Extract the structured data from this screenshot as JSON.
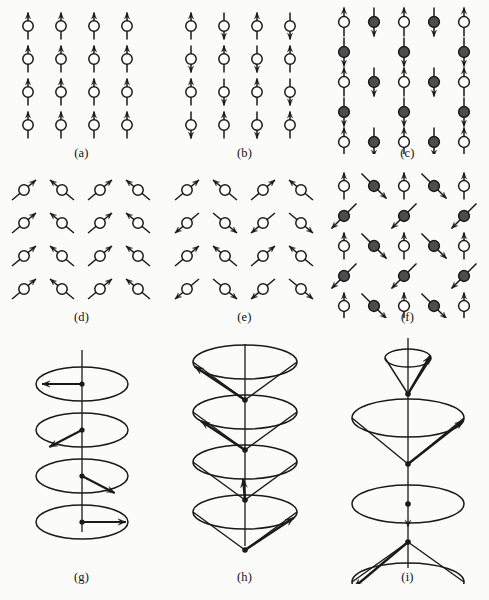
{
  "figure": {
    "background_color": "#fbfbf9",
    "ink_color": "#1a1a1a",
    "filled_circle_color": "#4d4d4d",
    "open_circle_color": "#ffffff",
    "width": 489,
    "height": 600
  },
  "panels": [
    {
      "id": "a",
      "caption": "(a)",
      "name": "ferromagnetic",
      "lattice": {
        "cols": 4,
        "rows": 4,
        "dx": 33,
        "dy": 33,
        "x0": 28,
        "y0": 22
      },
      "site_style": "open-circle-vertical-spin",
      "spins": [
        [
          "up",
          "up",
          "up",
          "up"
        ],
        [
          "up",
          "up",
          "up",
          "up"
        ],
        [
          "up",
          "up",
          "up",
          "up"
        ],
        [
          "up",
          "up",
          "up",
          "up"
        ]
      ]
    },
    {
      "id": "b",
      "caption": "(b)",
      "name": "antiferromagnetic",
      "lattice": {
        "cols": 4,
        "rows": 4,
        "dx": 33,
        "dy": 33,
        "x0": 28,
        "y0": 22
      },
      "site_style": "open-circle-vertical-spin",
      "spins": [
        [
          "up",
          "down",
          "up",
          "down"
        ],
        [
          "down",
          "up",
          "down",
          "up"
        ],
        [
          "up",
          "down",
          "up",
          "down"
        ],
        [
          "down",
          "up",
          "down",
          "up"
        ]
      ]
    },
    {
      "id": "c",
      "caption": "(c)",
      "name": "ferrimagnetic",
      "lattice": {
        "cols": 5,
        "rows": 5,
        "dx": 30,
        "dy": 30,
        "x0": 18,
        "y0": 18
      },
      "site_style": "two-sublattice-vertical-spin",
      "cells": [
        [
          {
            "fill": "open",
            "spin": "up"
          },
          {
            "fill": "solid",
            "spin": "down"
          },
          {
            "fill": "open",
            "spin": "up"
          },
          {
            "fill": "solid",
            "spin": "down"
          },
          {
            "fill": "open",
            "spin": "up"
          }
        ],
        [
          {
            "fill": "solid",
            "spin": "down"
          },
          {
            "fill": "none",
            "spin": "none"
          },
          {
            "fill": "solid",
            "spin": "down"
          },
          {
            "fill": "none",
            "spin": "none"
          },
          {
            "fill": "solid",
            "spin": "down"
          }
        ],
        [
          {
            "fill": "open",
            "spin": "up"
          },
          {
            "fill": "solid",
            "spin": "down"
          },
          {
            "fill": "open",
            "spin": "up"
          },
          {
            "fill": "solid",
            "spin": "down"
          },
          {
            "fill": "open",
            "spin": "up"
          }
        ],
        [
          {
            "fill": "solid",
            "spin": "down"
          },
          {
            "fill": "none",
            "spin": "none"
          },
          {
            "fill": "solid",
            "spin": "down"
          },
          {
            "fill": "none",
            "spin": "none"
          },
          {
            "fill": "solid",
            "spin": "down"
          }
        ],
        [
          {
            "fill": "open",
            "spin": "up"
          },
          {
            "fill": "solid",
            "spin": "down"
          },
          {
            "fill": "open",
            "spin": "up"
          },
          {
            "fill": "solid",
            "spin": "down"
          },
          {
            "fill": "open",
            "spin": "up"
          }
        ]
      ]
    },
    {
      "id": "d",
      "caption": "(d)",
      "name": "canted-ferromagnetic",
      "lattice": {
        "cols": 4,
        "rows": 4,
        "dx": 38,
        "dy": 33,
        "x0": 24,
        "y0": 22
      },
      "site_style": "open-circle-tilted-spin",
      "angles_deg": [
        [
          40,
          140,
          40,
          140
        ],
        [
          40,
          140,
          40,
          140
        ],
        [
          40,
          140,
          40,
          140
        ],
        [
          40,
          140,
          40,
          140
        ]
      ]
    },
    {
      "id": "e",
      "caption": "(e)",
      "name": "canted-antiferromagnetic",
      "lattice": {
        "cols": 4,
        "rows": 4,
        "dx": 38,
        "dy": 33,
        "x0": 24,
        "y0": 22
      },
      "site_style": "open-circle-tilted-spin",
      "angles_deg": [
        [
          40,
          140,
          40,
          140
        ],
        [
          220,
          320,
          220,
          320
        ],
        [
          40,
          140,
          40,
          140
        ],
        [
          220,
          320,
          220,
          320
        ]
      ]
    },
    {
      "id": "f",
      "caption": "(f)",
      "name": "mixed-sublattice-canted",
      "lattice": {
        "cols": 5,
        "rows": 5,
        "dx": 30,
        "dy": 30,
        "x0": 18,
        "y0": 18
      },
      "site_style": "two-sublattice-mixed-spin",
      "cells": [
        [
          {
            "fill": "open",
            "angle": 90
          },
          {
            "fill": "solid",
            "angle": -45
          },
          {
            "fill": "open",
            "angle": 90
          },
          {
            "fill": "solid",
            "angle": -45
          },
          {
            "fill": "open",
            "angle": 90
          }
        ],
        [
          {
            "fill": "solid",
            "angle": -135
          },
          {
            "fill": "none",
            "angle": null
          },
          {
            "fill": "solid",
            "angle": -135
          },
          {
            "fill": "none",
            "angle": null
          },
          {
            "fill": "solid",
            "angle": -135
          }
        ],
        [
          {
            "fill": "open",
            "angle": 90
          },
          {
            "fill": "solid",
            "angle": -45
          },
          {
            "fill": "open",
            "angle": 90
          },
          {
            "fill": "solid",
            "angle": -45
          },
          {
            "fill": "open",
            "angle": 90
          }
        ],
        [
          {
            "fill": "solid",
            "angle": -135
          },
          {
            "fill": "none",
            "angle": null
          },
          {
            "fill": "solid",
            "angle": -135
          },
          {
            "fill": "none",
            "angle": null
          },
          {
            "fill": "solid",
            "angle": -135
          }
        ],
        [
          {
            "fill": "open",
            "angle": 90
          },
          {
            "fill": "solid",
            "angle": -45
          },
          {
            "fill": "open",
            "angle": 90
          },
          {
            "fill": "solid",
            "angle": -45
          },
          {
            "fill": "open",
            "angle": 90
          }
        ]
      ]
    },
    {
      "id": "g",
      "caption": "(g)",
      "name": "helical-spiral",
      "axis": {
        "x": 82,
        "y_top": 14,
        "y_bottom": 196
      },
      "ellipses": [
        {
          "cy": 48,
          "rx": 46,
          "ry": 17,
          "arrow_angle_deg": 180,
          "arrow_len": 40,
          "cone": false
        },
        {
          "cy": 94,
          "rx": 46,
          "ry": 17,
          "arrow_angle_deg": 215,
          "arrow_len": 40,
          "cone": false
        },
        {
          "cy": 140,
          "rx": 46,
          "ry": 17,
          "arrow_angle_deg": 325,
          "arrow_len": 40,
          "cone": false
        },
        {
          "cy": 186,
          "rx": 46,
          "ry": 17,
          "arrow_angle_deg": 0,
          "arrow_len": 44,
          "cone": false
        }
      ]
    },
    {
      "id": "h",
      "caption": "(h)",
      "name": "conical-spiral",
      "axis": {
        "x": 82,
        "y_top": 8,
        "y_bottom": 210
      },
      "cones": [
        {
          "cy": 26,
          "rx": 52,
          "ry": 17,
          "apex_dy": 38,
          "arrow_angle_deg": 195
        },
        {
          "cy": 76,
          "rx": 52,
          "ry": 17,
          "apex_dy": 38,
          "arrow_angle_deg": 212
        },
        {
          "cy": 126,
          "rx": 52,
          "ry": 17,
          "apex_dy": 38,
          "arrow_angle_deg": 268
        },
        {
          "cy": 176,
          "rx": 52,
          "ry": 17,
          "apex_dy": 38,
          "arrow_angle_deg": 340
        }
      ]
    },
    {
      "id": "i",
      "caption": "(i)",
      "name": "amplitude-modulated-spiral",
      "axis": {
        "x": 82,
        "y_top": 2,
        "y_bottom": 232
      },
      "cones": [
        {
          "apex_y": 58,
          "rim_cy": 22,
          "rx": 23,
          "ry": 9,
          "arrow_angle_deg": 15,
          "flat": false
        },
        {
          "apex_y": 128,
          "rim_cy": 82,
          "rx": 56,
          "ry": 19,
          "arrow_angle_deg": 352,
          "flat": false
        },
        {
          "apex_y": 168,
          "rim_cy": 168,
          "rx": 56,
          "ry": 19,
          "arrow_angle_deg": 270,
          "flat": true
        },
        {
          "apex_y": 206,
          "rim_cy": 246,
          "rx": 56,
          "ry": 19,
          "arrow_angle_deg": 196,
          "flat": false
        },
        {
          "apex_y": 272,
          "rim_cy": 308,
          "rx": 23,
          "ry": 9,
          "arrow_angle_deg": 200,
          "flat": false
        }
      ]
    }
  ]
}
